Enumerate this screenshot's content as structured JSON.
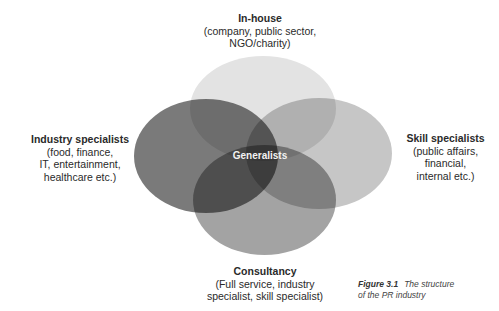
{
  "diagram": {
    "type": "venn",
    "sets": [
      {
        "id": "in-house",
        "title": "In-house",
        "detail": [
          "(company, public sector,",
          "NGO/charity)"
        ],
        "color": "#e3e3e3"
      },
      {
        "id": "industry-specialists",
        "title": "Industry specialists",
        "detail": [
          "(food, finance,",
          "IT, entertainment,",
          "healthcare etc.)"
        ],
        "color": "#6f6f6f"
      },
      {
        "id": "skill-specialists",
        "title": "Skill specialists",
        "detail": [
          "(public affairs,",
          "financial,",
          "internal etc.)"
        ],
        "color": "#c6c6c6"
      },
      {
        "id": "consultancy",
        "title": "Consultancy",
        "detail": [
          "(Full service, industry",
          "specialist, skill specialist)"
        ],
        "color": "#a0a0a0"
      }
    ],
    "center_label": "Generalists"
  },
  "caption": {
    "figure_number": "Figure 3.1",
    "text_line1": "The structure",
    "text_line2": "of the PR industry"
  }
}
